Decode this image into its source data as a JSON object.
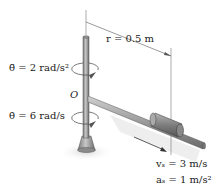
{
  "diagram": {
    "labels": {
      "r": "r = 0.5 m",
      "theta_ddot": "θ̈ = 2 rad/s²",
      "theta_dot": "θ̇ = 6 rad/s",
      "origin": "O",
      "v_s": "vₛ = 3 m/s",
      "a_s": "aₛ = 1 m/s²"
    },
    "colors": {
      "rod": "#9a9a9a",
      "rod_dark": "#6e6e6e",
      "collar": "#8a8a8a",
      "shadow": "#e6e6e6",
      "text": "#222222"
    }
  }
}
